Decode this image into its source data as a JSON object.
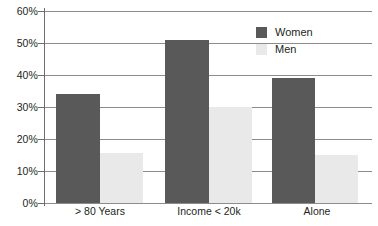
{
  "chart_data": {
    "type": "bar",
    "title": "",
    "subtitle": "",
    "xlabel": "",
    "ylabel": "",
    "categories": [
      "> 80 Years",
      "Income < 20k",
      "Alone"
    ],
    "series": [
      {
        "name": "Women",
        "color": "#595959",
        "values": [
          34,
          51,
          39
        ]
      },
      {
        "name": "Men",
        "color": "#e9e9e9",
        "values": [
          15.5,
          30,
          15
        ]
      }
    ],
    "ylim": [
      0,
      60
    ],
    "ytick_values": [
      60,
      50,
      40,
      30,
      20,
      10,
      0
    ],
    "ytick_labels": [
      "60%",
      "50%",
      "40%",
      "30%",
      "20%",
      "10%",
      "0%"
    ],
    "grid": true,
    "grid_axis": "y",
    "legend_position": "top-right",
    "value_suffix": "%"
  },
  "legend": {
    "entries": [
      {
        "label": "Women",
        "color": "#595959"
      },
      {
        "label": "Men",
        "color": "#e9e9e9"
      }
    ]
  },
  "axis": {
    "y_labels": [
      "60%",
      "50%",
      "40%",
      "30%",
      "20%",
      "10%",
      "0%"
    ],
    "x_labels": [
      "> 80 Years",
      "Income < 20k",
      "Alone"
    ]
  },
  "colors": {
    "women": "#595959",
    "men": "#e9e9e9",
    "grid": "#8c8c8c",
    "axis": "#6e6e6e",
    "text": "#231f20",
    "background": "#ffffff"
  }
}
